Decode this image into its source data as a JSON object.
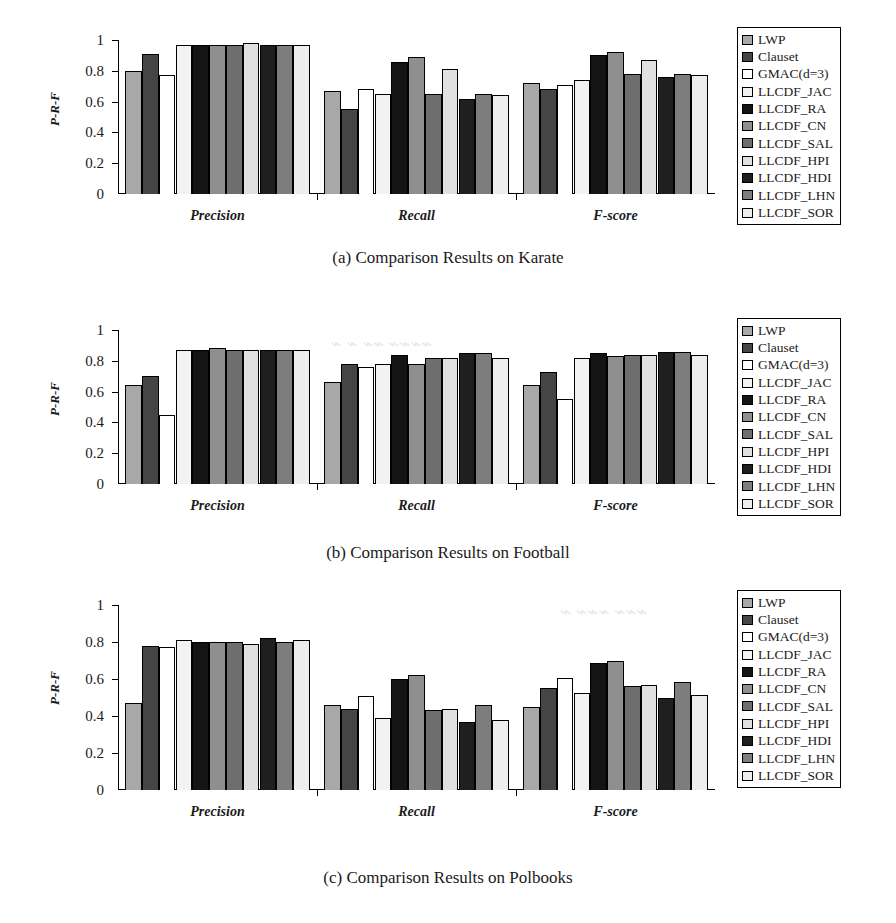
{
  "figure": {
    "panels": [
      {
        "id": "a",
        "caption": "(a) Comparison Results on Karate",
        "ylabel": "P-R-F"
      },
      {
        "id": "b",
        "caption": "(b) Comparison Results on Football",
        "ylabel": "P-R-F"
      },
      {
        "id": "c",
        "caption": "(c) Comparison Results on Polbooks",
        "ylabel": "P-R-F"
      }
    ]
  },
  "legend": {
    "position": "right",
    "entries": [
      {
        "label": "LWP",
        "color": "#a8a8a8"
      },
      {
        "label": "Clauset",
        "color": "#454545"
      },
      {
        "label": "GMAC(d=3)",
        "color": "#ffffff"
      },
      {
        "label": "LLCDF_JAC",
        "color": "#f2f2f2"
      },
      {
        "label": "LLCDF_RA",
        "color": "#141414"
      },
      {
        "label": "LLCDF_CN",
        "color": "#8f8f8f"
      },
      {
        "label": "LLCDF_SAL",
        "color": "#6e6e6e"
      },
      {
        "label": "LLCDF_HPI",
        "color": "#e0e0e0"
      },
      {
        "label": "LLCDF_HDI",
        "color": "#1f1f1f"
      },
      {
        "label": "LLCDF_LHN",
        "color": "#7d7d7d"
      },
      {
        "label": "LLCDF_SOR",
        "color": "#ededed"
      }
    ]
  },
  "chart_data": [
    {
      "type": "bar",
      "title": "(a) Comparison Results on Karate",
      "xlabel": "",
      "ylabel": "P-R-F",
      "ylim": [
        0,
        1
      ],
      "yticks": [
        "0",
        "0.2",
        "0.4",
        "0.6",
        "0.8",
        "1"
      ],
      "grid": false,
      "legend_position": "right",
      "categories": [
        "Precision",
        "Recall",
        "F-score"
      ],
      "series": [
        {
          "name": "LWP",
          "values": [
            0.8,
            0.67,
            0.72
          ]
        },
        {
          "name": "Clauset",
          "values": [
            0.91,
            0.55,
            0.68
          ]
        },
        {
          "name": "GMAC(d=3)",
          "values": [
            0.77,
            0.68,
            0.71
          ]
        },
        {
          "name": "LLCDF_JAC",
          "values": [
            0.97,
            0.65,
            0.74
          ]
        },
        {
          "name": "LLCDF_RA",
          "values": [
            0.97,
            0.86,
            0.9
          ]
        },
        {
          "name": "LLCDF_CN",
          "values": [
            0.97,
            0.89,
            0.92
          ]
        },
        {
          "name": "LLCDF_SAL",
          "values": [
            0.97,
            0.65,
            0.78
          ]
        },
        {
          "name": "LLCDF_HPI",
          "values": [
            0.98,
            0.81,
            0.87
          ]
        },
        {
          "name": "LLCDF_HDI",
          "values": [
            0.97,
            0.62,
            0.76
          ]
        },
        {
          "name": "LLCDF_LHN",
          "values": [
            0.97,
            0.65,
            0.78
          ]
        },
        {
          "name": "LLCDF_SOR",
          "values": [
            0.97,
            0.64,
            0.77
          ]
        }
      ]
    },
    {
      "type": "bar",
      "title": "(b) Comparison Results on Football",
      "xlabel": "",
      "ylabel": "P-R-F",
      "ylim": [
        0,
        1
      ],
      "yticks": [
        "0",
        "0.2",
        "0.4",
        "0.6",
        "0.8",
        "1"
      ],
      "grid": false,
      "legend_position": "right",
      "categories": [
        "Precision",
        "Recall",
        "F-score"
      ],
      "series": [
        {
          "name": "LWP",
          "values": [
            0.64,
            0.66,
            0.64
          ]
        },
        {
          "name": "Clauset",
          "values": [
            0.7,
            0.78,
            0.73
          ]
        },
        {
          "name": "GMAC(d=3)",
          "values": [
            0.45,
            0.76,
            0.55
          ]
        },
        {
          "name": "LLCDF_JAC",
          "values": [
            0.87,
            0.78,
            0.82
          ]
        },
        {
          "name": "LLCDF_RA",
          "values": [
            0.87,
            0.84,
            0.85
          ]
        },
        {
          "name": "LLCDF_CN",
          "values": [
            0.88,
            0.78,
            0.83
          ]
        },
        {
          "name": "LLCDF_SAL",
          "values": [
            0.87,
            0.82,
            0.84
          ]
        },
        {
          "name": "LLCDF_HPI",
          "values": [
            0.87,
            0.82,
            0.84
          ]
        },
        {
          "name": "LLCDF_HDI",
          "values": [
            0.87,
            0.85,
            0.86
          ]
        },
        {
          "name": "LLCDF_LHN",
          "values": [
            0.87,
            0.85,
            0.86
          ]
        },
        {
          "name": "LLCDF_SOR",
          "values": [
            0.87,
            0.82,
            0.84
          ]
        }
      ]
    },
    {
      "type": "bar",
      "title": "(c) Comparison Results on Polbooks",
      "xlabel": "",
      "ylabel": "P-R-F",
      "ylim": [
        0,
        1
      ],
      "yticks": [
        "0",
        "0.2",
        "0.4",
        "0.6",
        "0.8",
        "1"
      ],
      "grid": false,
      "legend_position": "right",
      "categories": [
        "Precision",
        "Recall",
        "F-score"
      ],
      "series": [
        {
          "name": "LWP",
          "values": [
            0.47,
            0.46,
            0.45
          ]
        },
        {
          "name": "Clauset",
          "values": [
            0.78,
            0.44,
            0.55
          ]
        },
        {
          "name": "GMAC(d=3)",
          "values": [
            0.775,
            0.51,
            0.605
          ]
        },
        {
          "name": "LLCDF_JAC",
          "values": [
            0.81,
            0.39,
            0.525
          ]
        },
        {
          "name": "LLCDF_RA",
          "values": [
            0.8,
            0.6,
            0.685
          ]
        },
        {
          "name": "LLCDF_CN",
          "values": [
            0.8,
            0.62,
            0.7
          ]
        },
        {
          "name": "LLCDF_SAL",
          "values": [
            0.8,
            0.43,
            0.56
          ]
        },
        {
          "name": "LLCDF_HPI",
          "values": [
            0.79,
            0.44,
            0.57
          ]
        },
        {
          "name": "LLCDF_HDI",
          "values": [
            0.82,
            0.365,
            0.5
          ]
        },
        {
          "name": "LLCDF_LHN",
          "values": [
            0.8,
            0.46,
            0.585
          ]
        },
        {
          "name": "LLCDF_SOR",
          "values": [
            0.81,
            0.38,
            0.515
          ]
        }
      ]
    }
  ]
}
